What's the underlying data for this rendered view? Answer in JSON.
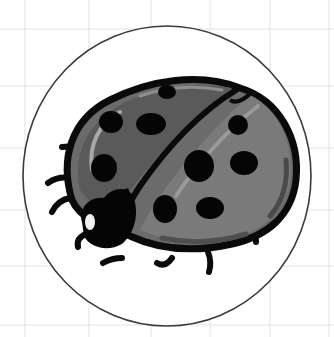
{
  "image": {
    "subject": "ladybug illustration",
    "style": "grayscale cartoon sticker in circle on grid paper"
  },
  "colors": {
    "background": "#ffffff",
    "grid_line": "#e2e2e2",
    "circle_outline": "#3a3a3a",
    "outline": "#0a0a0a",
    "shell_mid": "#6b6b6b",
    "shell_dark": "#4a4a4a",
    "shell_light": "#8e8e8e",
    "highlight": "#b8b8b8",
    "spot": "#050505",
    "eye": "#f0f0f0"
  },
  "grid": {
    "vertical_x": [
      25,
      89,
      151,
      210,
      270,
      329
    ],
    "horizontal_y": [
      29,
      86,
      148,
      210,
      266,
      325
    ]
  },
  "badge": {
    "cx": 167,
    "cy": 176,
    "rx": 144,
    "ry": 150
  }
}
